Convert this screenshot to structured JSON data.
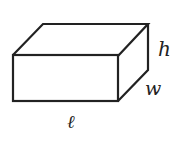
{
  "diagram": {
    "type": "rectangular-prism",
    "labels": {
      "length": "ℓ",
      "width": "w",
      "height": "h"
    },
    "colors": {
      "stroke": "#222222",
      "background": "#ffffff"
    }
  }
}
